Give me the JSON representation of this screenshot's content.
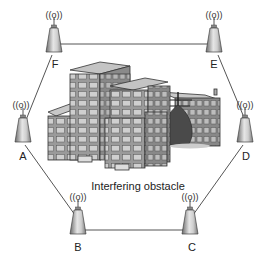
{
  "diagram": {
    "type": "wireless mesh ring network",
    "caption": "Interfering obstacle",
    "nodes": [
      {
        "id": "F",
        "label": "F",
        "x": 54,
        "y": 40
      },
      {
        "id": "E",
        "label": "E",
        "x": 214,
        "y": 40
      },
      {
        "id": "A",
        "label": "A",
        "x": 23,
        "y": 130
      },
      {
        "id": "D",
        "label": "D",
        "x": 245,
        "y": 130
      },
      {
        "id": "B",
        "label": "B",
        "x": 78,
        "y": 222
      },
      {
        "id": "C",
        "label": "C",
        "x": 190,
        "y": 222
      }
    ],
    "links": [
      [
        "F",
        "E"
      ],
      [
        "E",
        "D"
      ],
      [
        "D",
        "C"
      ],
      [
        "C",
        "B"
      ],
      [
        "B",
        "A"
      ],
      [
        "A",
        "F"
      ]
    ],
    "obstacle": {
      "kind": "buildings-and-tree",
      "label": "Interfering obstacle"
    },
    "signal_icon": "((o))",
    "colors": {
      "line": "#555555",
      "tower_dark": "#6e6e6e",
      "tower_light": "#d8d8d8",
      "building": "#a9a9a9",
      "tree": "#4a4a4a"
    }
  }
}
